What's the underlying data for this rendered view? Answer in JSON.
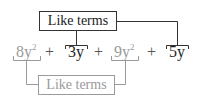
{
  "diagram": {
    "top_label": "Like terms",
    "bottom_label": "Like terms",
    "expression": [
      {
        "coef": "8",
        "var": "y",
        "exp": "2",
        "group": "bottom",
        "color": "#9a9a9a"
      },
      {
        "op": "+"
      },
      {
        "coef": "3",
        "var": "y",
        "exp": "",
        "group": "top",
        "color": "#1e1e1e"
      },
      {
        "op": "+"
      },
      {
        "coef": "9",
        "var": "y",
        "exp": "2",
        "group": "bottom",
        "color": "#9a9a9a"
      },
      {
        "op": "+"
      },
      {
        "coef": "5",
        "var": "y",
        "exp": "",
        "group": "top",
        "color": "#1e1e1e"
      }
    ],
    "terms": {
      "t1": {
        "base": "8y",
        "exp": "2"
      },
      "op1": "+",
      "t2": {
        "base": "3y"
      },
      "op2": "+",
      "t3": {
        "base": "9y",
        "exp": "2"
      },
      "op3": "+",
      "t4": {
        "base": "5y"
      }
    },
    "colors": {
      "dark": "#1e1e1e",
      "gray": "#9a9a9a",
      "top_border": "#333333"
    }
  }
}
